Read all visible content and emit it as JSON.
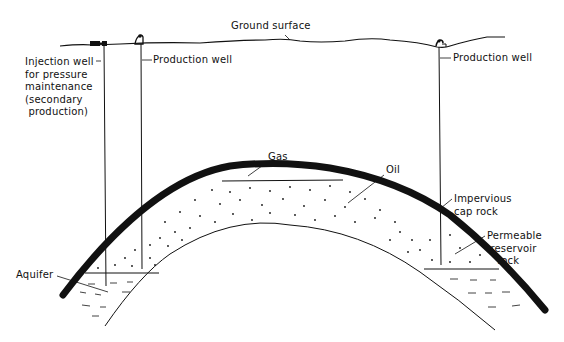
{
  "diagram": {
    "colors": {
      "ink": "#111111",
      "background": "#ffffff"
    },
    "labels": {
      "ground_surface": "Ground surface",
      "injection_well": "Injection well\nfor pressure\nmaintenance\n(secondary\n production)",
      "production_well_left": "Production well",
      "production_well_right": "Production well",
      "gas": "Gas",
      "oil": "Oil",
      "cap_rock": "Impervious\ncap rock",
      "reservoir_rock": "Permeable\n reservoir\n   rock",
      "aquifer": "Aquifer"
    },
    "wells": [
      {
        "name": "injection-well",
        "x": 104
      },
      {
        "name": "production-well-left",
        "x": 141
      },
      {
        "name": "production-well-right",
        "x": 439
      }
    ]
  }
}
